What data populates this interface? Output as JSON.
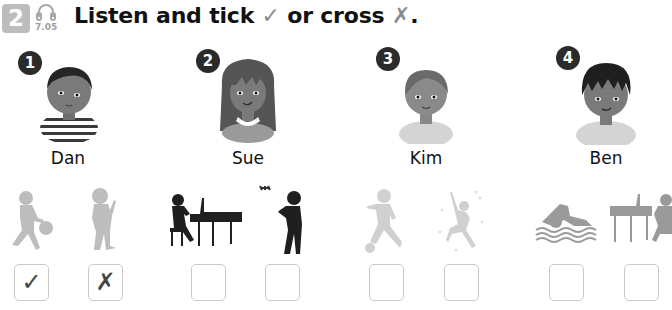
{
  "exercise": {
    "number": "2",
    "track": "7.05",
    "instruction_prefix": "Listen and tick ",
    "tick_symbol": "✓",
    "instruction_middle": " or cross ",
    "cross_symbol": "✗",
    "instruction_suffix": "."
  },
  "children": [
    {
      "number": "1",
      "name": "Dan",
      "activities": [
        {
          "icon": "basketball-player-icon",
          "answer": "✓"
        },
        {
          "icon": "child-eating-ice-cream-icon",
          "answer": "✗"
        }
      ]
    },
    {
      "number": "2",
      "name": "Sue",
      "activities": [
        {
          "icon": "piano-player-icon",
          "answer": ""
        },
        {
          "icon": "child-flying-drone-icon",
          "answer": ""
        }
      ]
    },
    {
      "number": "3",
      "name": "Kim",
      "activities": [
        {
          "icon": "football-player-icon",
          "answer": ""
        },
        {
          "icon": "climber-icon",
          "answer": ""
        }
      ]
    },
    {
      "number": "4",
      "name": "Ben",
      "activities": [
        {
          "icon": "swimmer-icon",
          "answer": ""
        },
        {
          "icon": "piano-player-icon",
          "answer": ""
        }
      ]
    }
  ],
  "colors": {
    "badge": "#2b2b2b",
    "exercise_number_bg": "#bdbdbd",
    "box_border": "#c9c9c9",
    "silhouette_light": "#bdbdbd",
    "silhouette_dark": "#1f1f1f",
    "silhouette_mid": "#9a9a9a"
  }
}
